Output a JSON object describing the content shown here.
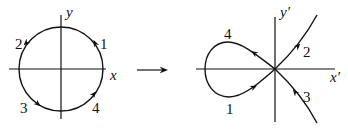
{
  "left_diagram": {
    "axis_x_label": "x",
    "axis_y_label": "y",
    "arc_labels": [
      "1",
      "2",
      "3",
      "4"
    ]
  },
  "mapping_arrow": "right-arrow",
  "right_diagram": {
    "axis_x_label": "x′",
    "axis_y_label": "y′",
    "curve_labels": [
      "1",
      "2",
      "3",
      "4"
    ]
  },
  "colors": {
    "stroke": "#111111",
    "background": "#ffffff"
  }
}
